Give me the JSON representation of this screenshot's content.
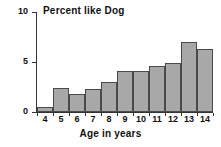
{
  "chart_data": {
    "type": "bar",
    "title": "Percent like Dog",
    "xlabel": "Age in years",
    "ylabel": "",
    "categories": [
      "4",
      "5",
      "6",
      "7",
      "8",
      "9",
      "10",
      "11",
      "12",
      "13",
      "14"
    ],
    "values": [
      0.5,
      2.4,
      1.8,
      2.3,
      3.0,
      4.1,
      4.1,
      4.6,
      4.9,
      7.0,
      6.3
    ],
    "ylim": [
      0,
      10
    ],
    "xlim": [
      4,
      14
    ],
    "yticks": [
      "0",
      "5",
      "10"
    ],
    "ytick_values": [
      0,
      5,
      10
    ],
    "grid": false,
    "legend": null,
    "legend_position": "none",
    "bar_fill_color": "#a8a8a8",
    "bar_edge_color": "#4a4a4a",
    "axis_color": "#333333",
    "background_color": "#ffffff",
    "text_color": "#111111"
  },
  "axes": {
    "y_axis_name": "percent-axis",
    "x_axis_name": "age-axis"
  }
}
